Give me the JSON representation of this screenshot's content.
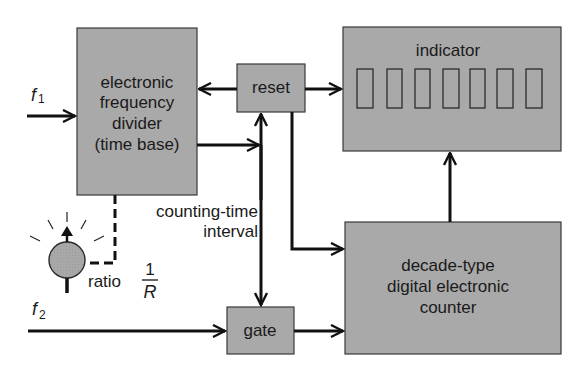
{
  "diagram": {
    "type": "block-diagram",
    "title": "",
    "blocks": {
      "divider": {
        "lines": [
          "electronic",
          "frequency",
          "divider",
          "(time base)"
        ]
      },
      "reset": {
        "label": "reset"
      },
      "indicator": {
        "label": "indicator",
        "digit_count": 7
      },
      "counter": {
        "lines": [
          "decade-type",
          "digital electronic",
          "counter"
        ]
      },
      "gate": {
        "label": "gate"
      }
    },
    "inputs": {
      "f1": {
        "symbol": "f",
        "subscript": "1"
      },
      "f2": {
        "symbol": "f",
        "subscript": "2"
      }
    },
    "annotations": {
      "counting_time": [
        "counting-time",
        "interval"
      ],
      "ratio_label": "ratio",
      "ratio_numerator": "1",
      "ratio_denominator": "R"
    },
    "connections": [
      {
        "from": "f1",
        "to": "divider"
      },
      {
        "from": "reset",
        "to": "divider"
      },
      {
        "from": "reset",
        "to": "indicator"
      },
      {
        "from": "divider",
        "to": "reset/gate line"
      },
      {
        "from": "gate-line",
        "to": "reset"
      },
      {
        "from": "gate-line",
        "to": "gate",
        "label": "counting-time interval"
      },
      {
        "from": "reset",
        "to": "counter"
      },
      {
        "from": "f2",
        "to": "gate"
      },
      {
        "from": "gate",
        "to": "counter"
      },
      {
        "from": "counter",
        "to": "indicator"
      },
      {
        "from": "ratio-knob",
        "to": "divider",
        "style": "dashed"
      }
    ]
  }
}
